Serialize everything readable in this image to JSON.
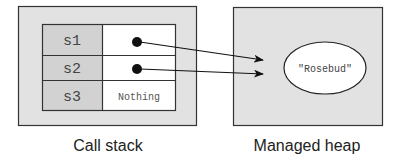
{
  "colors": {
    "panel_fill": "#e2e2e2",
    "label_cell_fill": "#d2d2d2",
    "value_cell_fill": "#ffffff",
    "stroke": "#333333",
    "pointer": "#111111"
  },
  "call_stack": {
    "caption": "Call stack",
    "rows": [
      {
        "name": "s1",
        "value": "",
        "kind": "pointer"
      },
      {
        "name": "s2",
        "value": "",
        "kind": "pointer"
      },
      {
        "name": "s3",
        "value": "Nothing",
        "kind": "text"
      }
    ]
  },
  "managed_heap": {
    "caption": "Managed heap",
    "object": {
      "value": "\"Rosebud\""
    }
  },
  "references": [
    {
      "from": "s1",
      "to": "\"Rosebud\""
    },
    {
      "from": "s2",
      "to": "\"Rosebud\""
    }
  ]
}
